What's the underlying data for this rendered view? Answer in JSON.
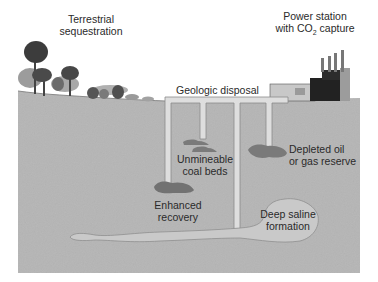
{
  "diagram": {
    "labels": {
      "terrestrial_line1": "Terrestrial",
      "terrestrial_line2": "sequestration",
      "power_line1": "Power station",
      "power_line2_pre": "with CO",
      "power_line2_sub": "2",
      "power_line2_post": " capture",
      "geologic": "Geologic disposal",
      "coal_line1": "Unmineable",
      "coal_line2": "coal beds",
      "depleted_line1": "Depleted oil",
      "depleted_line2": "or gas reserve",
      "enhanced_line1": "Enhanced",
      "enhanced_line2": "recovery",
      "saline_line1": "Deep saline",
      "saline_line2": "formation"
    },
    "elements": [
      {
        "name": "trees",
        "meaning": "terrestrial sequestration"
      },
      {
        "name": "power-station",
        "meaning": "power station with CO2 capture"
      },
      {
        "name": "pipeline",
        "meaning": "geologic disposal injection network"
      },
      {
        "name": "coal-beds",
        "meaning": "unmineable coal beds"
      },
      {
        "name": "oil-gas-reservoir",
        "meaning": "depleted oil or gas reserve"
      },
      {
        "name": "enhanced-recovery-reservoir",
        "meaning": "enhanced recovery"
      },
      {
        "name": "saline-formation",
        "meaning": "deep saline formation"
      }
    ],
    "colors": {
      "ground": "#b3b3b3",
      "pipe": "#dcdcdc",
      "reservoir": "#7a7a7a",
      "saline": "#c7c7c7",
      "text": "#2a2a2a"
    }
  }
}
